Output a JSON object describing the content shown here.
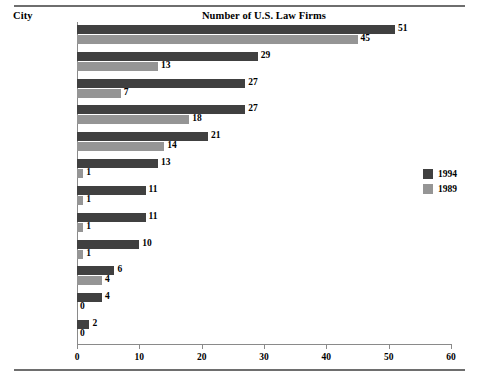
{
  "header": {
    "category_header": "City",
    "title": "Number of U.S. Law Firms"
  },
  "legend": {
    "items": [
      {
        "label": "1994",
        "color": "#404040"
      },
      {
        "label": "1989",
        "color": "#959595"
      }
    ]
  },
  "axis": {
    "ticklabels": [
      "0",
      "10",
      "20",
      "30",
      "40",
      "50",
      "60"
    ]
  },
  "chart_data": {
    "type": "bar",
    "orientation": "horizontal",
    "title": "Number of U.S. Law Firms",
    "xlabel": "",
    "ylabel": "City",
    "xlim": [
      0,
      60
    ],
    "xticks": [
      0,
      10,
      20,
      30,
      40,
      50,
      60
    ],
    "grid": false,
    "legend_position": "right",
    "categories": [
      "London",
      "Hong Kong",
      "Brussels",
      "Tokyo",
      "Paris",
      "Moscow",
      "Budapest",
      "Frankfurt",
      "Mexico City",
      "Beijing",
      "Jakarta",
      "Hanoi"
    ],
    "series": [
      {
        "name": "1994",
        "color": "#404040",
        "values": [
          51,
          29,
          27,
          27,
          21,
          13,
          11,
          11,
          10,
          6,
          4,
          2
        ]
      },
      {
        "name": "1989",
        "color": "#959595",
        "values": [
          45,
          13,
          7,
          18,
          14,
          1,
          1,
          1,
          1,
          4,
          0,
          0
        ]
      }
    ],
    "data_labels": {
      "1994": [
        "51",
        "29",
        "27",
        "27",
        "21",
        "13",
        "11",
        "11",
        "10",
        "6",
        "4",
        "2"
      ],
      "1989": [
        "45",
        "13",
        "7",
        "18",
        "14",
        "1",
        "1",
        "1",
        "1",
        "4",
        "0",
        "0"
      ]
    }
  }
}
